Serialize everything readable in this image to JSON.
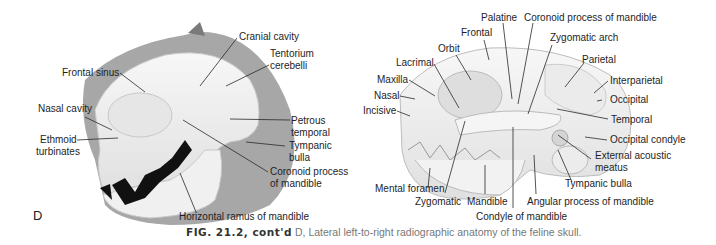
{
  "figure": {
    "panel": "D",
    "caption": {
      "fig_label": "FIG. 21.2, cont'd",
      "text": " D, Lateral left-to-right radiographic anatomy of the feline skull."
    }
  },
  "left_diagram": {
    "title": "Feline skull lateral radiographic view",
    "labels": [
      "Cranial cavity",
      "Tentorium",
      "cerebelli",
      "Frontal sinus",
      "Nasal cavity",
      "Petrous",
      "temporal",
      "Ethmoid",
      "turbinates",
      "Tympanic",
      "bulla",
      "Coronoid process",
      "of mandible",
      "Horizontal ramus of mandible"
    ]
  },
  "right_diagram": {
    "title": "Feline skull lateral anatomy",
    "labels": [
      "Palatine",
      "Coronoid process of mandible",
      "Frontal",
      "Zygomatic arch",
      "Orbit",
      "Parietal",
      "Lacrimal",
      "Maxilla",
      "Interparietal",
      "Nasal",
      "Occipital",
      "Incisive",
      "Temporal",
      "Occipital condyle",
      "External acoustic",
      "meatus",
      "Tympanic bulla",
      "Mental foramen",
      "Zygomatic",
      "Mandible",
      "Angular process of mandible",
      "Condyle of mandible"
    ]
  },
  "colors": {
    "bone": "#f2f2f2",
    "bone_shade": "#d9d9d9",
    "soft_tissue": "#7a7a7a",
    "teeth_dark": "#111111",
    "leader": "#333333"
  }
}
